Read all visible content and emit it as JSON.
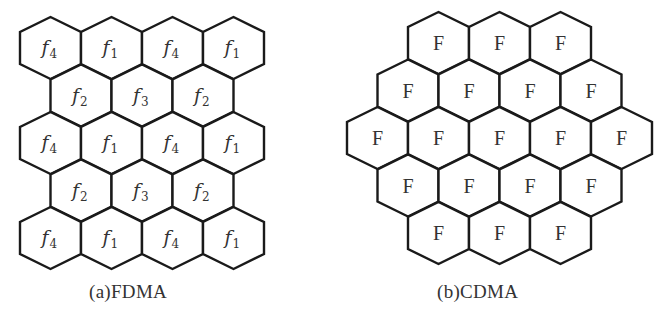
{
  "figure": {
    "background": "#ffffff",
    "stroke_color": "#1a1a1a",
    "text_color": "#333333",
    "hex": {
      "width": 61,
      "height": 62,
      "shoulder": 15
    },
    "panels": [
      {
        "id": "fdma",
        "caption": "(a)FDMA",
        "caption_pos": {
          "x": 89,
          "y": 281
        },
        "label_style": "subscript",
        "row_step": 47.5,
        "rows": [
          {
            "x0": 20,
            "y0": 17,
            "cells": [
              {
                "base": "f",
                "sub": "4"
              },
              {
                "base": "f",
                "sub": "1"
              },
              {
                "base": "f",
                "sub": "4"
              },
              {
                "base": "f",
                "sub": "1"
              }
            ]
          },
          {
            "x0": 50.5,
            "y0": 64.5,
            "cells": [
              {
                "base": "f",
                "sub": "2"
              },
              {
                "base": "f",
                "sub": "3"
              },
              {
                "base": "f",
                "sub": "2"
              }
            ]
          },
          {
            "x0": 20,
            "y0": 112,
            "cells": [
              {
                "base": "f",
                "sub": "4"
              },
              {
                "base": "f",
                "sub": "1"
              },
              {
                "base": "f",
                "sub": "4"
              },
              {
                "base": "f",
                "sub": "1"
              }
            ]
          },
          {
            "x0": 50.5,
            "y0": 159.5,
            "cells": [
              {
                "base": "f",
                "sub": "2"
              },
              {
                "base": "f",
                "sub": "3"
              },
              {
                "base": "f",
                "sub": "2"
              }
            ]
          },
          {
            "x0": 20,
            "y0": 207,
            "cells": [
              {
                "base": "f",
                "sub": "4"
              },
              {
                "base": "f",
                "sub": "1"
              },
              {
                "base": "f",
                "sub": "4"
              },
              {
                "base": "f",
                "sub": "1"
              }
            ]
          }
        ]
      },
      {
        "id": "cdma",
        "caption": "(b)CDMA",
        "caption_pos": {
          "x": 437,
          "y": 281
        },
        "label_style": "plain",
        "rows": [
          {
            "x0": 408,
            "y0": 12,
            "cells": [
              {
                "base": "F"
              },
              {
                "base": "F"
              },
              {
                "base": "F"
              }
            ]
          },
          {
            "x0": 377.5,
            "y0": 59.5,
            "cells": [
              {
                "base": "F"
              },
              {
                "base": "F"
              },
              {
                "base": "F"
              },
              {
                "base": "F"
              }
            ]
          },
          {
            "x0": 347,
            "y0": 107,
            "cells": [
              {
                "base": "F"
              },
              {
                "base": "F"
              },
              {
                "base": "F"
              },
              {
                "base": "F"
              },
              {
                "base": "F"
              }
            ]
          },
          {
            "x0": 377.5,
            "y0": 154.5,
            "cells": [
              {
                "base": "F"
              },
              {
                "base": "F"
              },
              {
                "base": "F"
              },
              {
                "base": "F"
              }
            ]
          },
          {
            "x0": 408,
            "y0": 202,
            "cells": [
              {
                "base": "F"
              },
              {
                "base": "F"
              },
              {
                "base": "F"
              }
            ]
          }
        ]
      }
    ],
    "captions": {
      "fdma": "(a)FDMA",
      "cdma": "(b)CDMA"
    }
  }
}
